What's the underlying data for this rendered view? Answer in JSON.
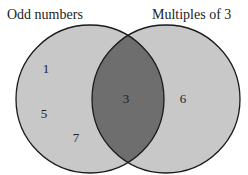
{
  "diagram": {
    "type": "venn",
    "sets": [
      {
        "name": "odd",
        "label": "Odd numbers",
        "only_elements": [
          "1",
          "5",
          "7"
        ]
      },
      {
        "name": "mult3",
        "label": "Multiples of 3",
        "only_elements": [
          "6"
        ]
      }
    ],
    "intersection": [
      "3"
    ],
    "colors": {
      "circle_fill": "#c8c8c8",
      "intersection_fill": "#6e6e6e",
      "stroke": "#1a1a1a",
      "background": "#ffffff"
    }
  },
  "labels": {
    "left": "Odd numbers",
    "right": "Multiples of 3"
  },
  "numbers": {
    "n1": "1",
    "n5": "5",
    "n7": "7",
    "n3": "3",
    "n6": "6"
  }
}
